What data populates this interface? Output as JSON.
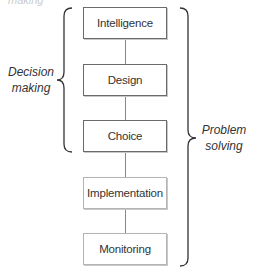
{
  "diagram": {
    "top_fragment": "making",
    "phases": [
      {
        "label": "Intelligence",
        "group": "decision"
      },
      {
        "label": "Design",
        "group": "decision"
      },
      {
        "label": "Choice",
        "group": "decision"
      },
      {
        "label": "Implementation",
        "group": "problem"
      },
      {
        "label": "Monitoring",
        "group": "problem"
      }
    ],
    "left_brace": {
      "line1": "Decision",
      "line2": "making"
    },
    "right_brace": {
      "line1": "Problem",
      "line2": "solving"
    },
    "colors": {
      "dark_border": "#6a6a6a",
      "light_border": "#b4b4b4",
      "text": "#333333"
    }
  }
}
